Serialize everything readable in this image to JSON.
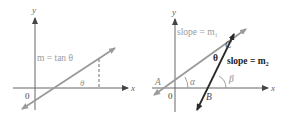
{
  "panels": [
    {
      "id": "left",
      "axes": {
        "x_label": "x",
        "y_label": "y",
        "origin_label": "0"
      },
      "line_label": "m = tan θ",
      "angle_label": "θ"
    },
    {
      "id": "right",
      "axes": {
        "x_label": "x",
        "y_label": "y",
        "origin_label": "0"
      },
      "line1_label": "slope = m₁",
      "line2_label": "slope = m₂",
      "points": {
        "A": "A",
        "B": "B",
        "C": "C"
      },
      "angles": {
        "theta": "θ",
        "alpha": "α",
        "beta": "β"
      }
    }
  ],
  "colors": {
    "axis": "#555555",
    "line_gray": "#9a9a9a",
    "line_dark": "#2a2a2a",
    "text_gray": "#9a9a9a",
    "text_dark": "#222222"
  }
}
